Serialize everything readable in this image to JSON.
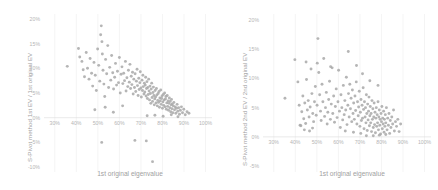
{
  "figure": {
    "background": "#ffffff",
    "marker_color": "#a8a8a8",
    "gridline_color": "#e9e9e9",
    "axis_color": "#dcdcdc",
    "text_color": "#a0a0a0"
  },
  "chart_data": [
    {
      "type": "scatter",
      "panel": "left",
      "title": "",
      "xlabel": "1st original eigenvalue",
      "ylabel": "S-Pivot method 1st EV / 1st original EV",
      "xticklabels": [
        "30%",
        "40%",
        "50%",
        "60%",
        "70%",
        "80%",
        "90%",
        "100%"
      ],
      "xtickvalues": [
        30,
        40,
        50,
        60,
        70,
        80,
        90,
        100
      ],
      "yticklabels": [
        "20%",
        "15%",
        "10%",
        "5%",
        "0%",
        "-5%",
        "-10%"
      ],
      "ytickvalues": [
        20,
        15,
        10,
        5,
        0,
        -5,
        -10
      ],
      "xlim": [
        25,
        103
      ],
      "ylim": [
        -11,
        21
      ],
      "grid": "vertical-light",
      "legend": "none",
      "n_points": 352,
      "correlation": -0.72,
      "cluster_center": [
        78,
        3.0
      ],
      "points": [
        [
          35.8,
          10.4
        ],
        [
          41.0,
          14.0
        ],
        [
          41.6,
          12.3
        ],
        [
          42.6,
          11.4
        ],
        [
          43.2,
          9.7
        ],
        [
          43.8,
          8.3
        ],
        [
          44.6,
          13.2
        ],
        [
          45.2,
          10.0
        ],
        [
          45.9,
          7.8
        ],
        [
          46.4,
          12.0
        ],
        [
          47.1,
          9.0
        ],
        [
          47.6,
          6.4
        ],
        [
          48.2,
          11.2
        ],
        [
          48.8,
          8.6
        ],
        [
          49.3,
          5.5
        ],
        [
          49.9,
          13.9
        ],
        [
          50.4,
          10.6
        ],
        [
          50.9,
          7.4
        ],
        [
          51.3,
          16.8
        ],
        [
          51.6,
          18.6
        ],
        [
          51.9,
          15.4
        ],
        [
          52.1,
          12.9
        ],
        [
          52.4,
          9.6
        ],
        [
          52.8,
          6.8
        ],
        [
          53.2,
          4.3
        ],
        [
          53.6,
          11.8
        ],
        [
          54.1,
          8.9
        ],
        [
          54.6,
          14.6
        ],
        [
          55.0,
          6.1
        ],
        [
          55.5,
          10.2
        ],
        [
          56.0,
          7.6
        ],
        [
          56.4,
          12.6
        ],
        [
          56.9,
          9.1
        ],
        [
          57.3,
          5.8
        ],
        [
          57.8,
          8.2
        ],
        [
          58.2,
          11.0
        ],
        [
          58.7,
          6.6
        ],
        [
          59.1,
          9.4
        ],
        [
          59.6,
          7.1
        ],
        [
          60.0,
          12.2
        ],
        [
          60.4,
          5.0
        ],
        [
          60.8,
          8.8
        ],
        [
          61.2,
          10.3
        ],
        [
          61.6,
          6.9
        ],
        [
          62.0,
          9.0
        ],
        [
          62.4,
          7.5
        ],
        [
          62.8,
          11.4
        ],
        [
          63.1,
          5.4
        ],
        [
          63.5,
          8.1
        ],
        [
          63.9,
          6.3
        ],
        [
          64.2,
          9.6
        ],
        [
          64.6,
          7.2
        ],
        [
          64.9,
          10.8
        ],
        [
          65.2,
          5.9
        ],
        [
          65.5,
          8.4
        ],
        [
          65.8,
          6.7
        ],
        [
          66.1,
          9.2
        ],
        [
          66.4,
          4.8
        ],
        [
          66.7,
          7.8
        ],
        [
          67.0,
          6.1
        ],
        [
          67.3,
          8.9
        ],
        [
          67.6,
          5.3
        ],
        [
          67.9,
          7.4
        ],
        [
          68.2,
          9.8
        ],
        [
          68.4,
          6.5
        ],
        [
          68.7,
          4.5
        ],
        [
          69.0,
          8.0
        ],
        [
          69.2,
          5.7
        ],
        [
          69.5,
          7.1
        ],
        [
          69.7,
          9.3
        ],
        [
          70.0,
          6.0
        ],
        [
          70.2,
          4.2
        ],
        [
          70.5,
          7.6
        ],
        [
          70.7,
          5.5
        ],
        [
          70.9,
          8.6
        ],
        [
          71.1,
          6.3
        ],
        [
          71.4,
          4.8
        ],
        [
          71.6,
          7.0
        ],
        [
          71.8,
          5.2
        ],
        [
          72.0,
          6.6
        ],
        [
          72.2,
          8.2
        ],
        [
          72.4,
          4.4
        ],
        [
          72.6,
          5.9
        ],
        [
          72.8,
          7.3
        ],
        [
          73.0,
          3.9
        ],
        [
          73.2,
          6.1
        ],
        [
          73.4,
          4.7
        ],
        [
          73.6,
          7.8
        ],
        [
          73.8,
          5.4
        ],
        [
          74.0,
          3.6
        ],
        [
          74.2,
          6.4
        ],
        [
          74.4,
          4.9
        ],
        [
          74.6,
          2.9
        ],
        [
          74.8,
          5.8
        ],
        [
          75.0,
          7.0
        ],
        [
          75.2,
          4.1
        ],
        [
          75.4,
          3.3
        ],
        [
          75.6,
          5.1
        ],
        [
          75.8,
          6.2
        ],
        [
          76.0,
          4.5
        ],
        [
          76.2,
          2.6
        ],
        [
          76.4,
          3.8
        ],
        [
          76.6,
          5.5
        ],
        [
          76.8,
          4.2
        ],
        [
          77.0,
          3.0
        ],
        [
          77.2,
          5.9
        ],
        [
          77.4,
          4.6
        ],
        [
          77.6,
          2.4
        ],
        [
          77.8,
          3.5
        ],
        [
          78.0,
          4.9
        ],
        [
          78.2,
          3.1
        ],
        [
          78.4,
          5.3
        ],
        [
          78.6,
          2.1
        ],
        [
          78.8,
          4.0
        ],
        [
          79.0,
          3.4
        ],
        [
          79.2,
          5.6
        ],
        [
          79.4,
          2.7
        ],
        [
          79.6,
          3.9
        ],
        [
          79.8,
          4.4
        ],
        [
          80.0,
          1.9
        ],
        [
          80.2,
          3.2
        ],
        [
          80.4,
          4.7
        ],
        [
          80.6,
          2.5
        ],
        [
          80.8,
          3.6
        ],
        [
          81.0,
          5.0
        ],
        [
          81.2,
          2.2
        ],
        [
          81.4,
          3.8
        ],
        [
          81.6,
          4.3
        ],
        [
          81.8,
          1.7
        ],
        [
          82.0,
          3.0
        ],
        [
          82.2,
          4.5
        ],
        [
          82.4,
          2.3
        ],
        [
          82.6,
          3.4
        ],
        [
          82.8,
          1.5
        ],
        [
          83.0,
          2.9
        ],
        [
          83.2,
          4.0
        ],
        [
          83.4,
          2.0
        ],
        [
          83.6,
          3.3
        ],
        [
          83.8,
          1.2
        ],
        [
          84.0,
          2.6
        ],
        [
          84.2,
          3.7
        ],
        [
          84.4,
          1.8
        ],
        [
          84.6,
          2.8
        ],
        [
          84.8,
          1.0
        ],
        [
          85.0,
          2.4
        ],
        [
          85.3,
          3.1
        ],
        [
          85.6,
          1.6
        ],
        [
          85.9,
          2.2
        ],
        [
          86.2,
          0.9
        ],
        [
          86.5,
          1.9
        ],
        [
          86.8,
          2.7
        ],
        [
          87.1,
          1.3
        ],
        [
          87.5,
          2.0
        ],
        [
          87.9,
          0.7
        ],
        [
          88.3,
          1.5
        ],
        [
          88.8,
          2.2
        ],
        [
          89.3,
          1.0
        ],
        [
          89.9,
          1.7
        ],
        [
          90.6,
          0.6
        ],
        [
          91.4,
          1.2
        ],
        [
          92.3,
          0.9
        ],
        [
          48.6,
          1.6
        ],
        [
          53.4,
          2.1
        ],
        [
          57.2,
          1.1
        ],
        [
          61.5,
          2.4
        ],
        [
          72.9,
          0.4
        ],
        [
          76.5,
          0.5
        ],
        [
          80.3,
          0.3
        ],
        [
          84.1,
          0.6
        ],
        [
          87.2,
          0.2
        ],
        [
          51.8,
          -5.0
        ],
        [
          67.2,
          -4.6
        ],
        [
          72.5,
          -4.7
        ],
        [
          75.4,
          -8.9
        ]
      ]
    },
    {
      "type": "scatter",
      "panel": "right",
      "title": "",
      "xlabel": "1st original eigenvalue",
      "ylabel": "S-Pivot method 2nd EV / 2nd original EV",
      "xticklabels": [
        "30%",
        "40%",
        "50%",
        "60%",
        "70%",
        "80%",
        "90%",
        "100%"
      ],
      "xtickvalues": [
        30,
        40,
        50,
        60,
        70,
        80,
        90,
        100
      ],
      "yticklabels": [
        "20%",
        "15%",
        "10%",
        "5%",
        "0%",
        "-5%"
      ],
      "ytickvalues": [
        20,
        15,
        10,
        5,
        0,
        -5
      ],
      "xlim": [
        25,
        103
      ],
      "ylim": [
        -6,
        21
      ],
      "grid": "vertical-light",
      "legend": "none",
      "n_points": 348,
      "correlation": -0.18,
      "cluster_center": [
        75,
        2.6
      ],
      "points": [
        [
          35.2,
          6.6
        ],
        [
          39.8,
          13.2
        ],
        [
          41.2,
          9.4
        ],
        [
          41.8,
          5.4
        ],
        [
          42.2,
          2.0
        ],
        [
          42.6,
          1.9
        ],
        [
          43.0,
          4.3
        ],
        [
          43.5,
          7.0
        ],
        [
          43.9,
          3.1
        ],
        [
          44.4,
          5.8
        ],
        [
          44.8,
          2.3
        ],
        [
          45.2,
          9.8
        ],
        [
          45.6,
          4.6
        ],
        [
          46.0,
          6.2
        ],
        [
          46.4,
          3.4
        ],
        [
          46.9,
          5.1
        ],
        [
          47.3,
          11.6
        ],
        [
          47.7,
          7.4
        ],
        [
          48.1,
          4.0
        ],
        [
          48.5,
          2.6
        ],
        [
          48.9,
          6.0
        ],
        [
          49.3,
          8.6
        ],
        [
          49.7,
          3.7
        ],
        [
          50.1,
          5.4
        ],
        [
          50.5,
          16.8
        ],
        [
          50.9,
          11.0
        ],
        [
          51.3,
          7.2
        ],
        [
          51.7,
          4.4
        ],
        [
          52.0,
          2.8
        ],
        [
          52.4,
          9.0
        ],
        [
          52.8,
          6.0
        ],
        [
          53.2,
          13.4
        ],
        [
          53.6,
          3.5
        ],
        [
          54.0,
          5.0
        ],
        [
          54.4,
          7.6
        ],
        [
          54.8,
          2.2
        ],
        [
          55.1,
          4.2
        ],
        [
          55.5,
          6.4
        ],
        [
          55.9,
          9.5
        ],
        [
          56.3,
          3.0
        ],
        [
          56.7,
          5.6
        ],
        [
          57.1,
          11.8
        ],
        [
          57.4,
          4.0
        ],
        [
          57.8,
          7.0
        ],
        [
          58.2,
          2.5
        ],
        [
          58.6,
          5.2
        ],
        [
          59.0,
          8.2
        ],
        [
          59.4,
          3.3
        ],
        [
          59.8,
          6.0
        ],
        [
          60.1,
          11.4
        ],
        [
          60.5,
          4.4
        ],
        [
          60.9,
          1.6
        ],
        [
          61.2,
          7.2
        ],
        [
          61.6,
          5.0
        ],
        [
          62.0,
          2.9
        ],
        [
          62.3,
          8.8
        ],
        [
          62.7,
          3.8
        ],
        [
          63.0,
          6.2
        ],
        [
          63.4,
          4.6
        ],
        [
          63.7,
          10.2
        ],
        [
          64.0,
          2.1
        ],
        [
          64.4,
          5.4
        ],
        [
          64.7,
          7.4
        ],
        [
          65.0,
          3.4
        ],
        [
          65.3,
          9.0
        ],
        [
          65.6,
          4.8
        ],
        [
          65.9,
          6.6
        ],
        [
          66.2,
          2.6
        ],
        [
          66.5,
          8.0
        ],
        [
          66.8,
          4.0
        ],
        [
          67.1,
          5.8
        ],
        [
          67.4,
          3.0
        ],
        [
          67.7,
          7.0
        ],
        [
          68.0,
          4.5
        ],
        [
          68.3,
          9.4
        ],
        [
          68.6,
          2.2
        ],
        [
          68.9,
          6.0
        ],
        [
          69.2,
          3.6
        ],
        [
          69.4,
          5.1
        ],
        [
          69.7,
          7.8
        ],
        [
          70.0,
          1.8
        ],
        [
          70.2,
          4.2
        ],
        [
          70.5,
          6.4
        ],
        [
          70.7,
          2.8
        ],
        [
          71.0,
          5.4
        ],
        [
          71.2,
          3.2
        ],
        [
          71.5,
          8.4
        ],
        [
          71.7,
          4.7
        ],
        [
          71.9,
          1.4
        ],
        [
          72.1,
          6.0
        ],
        [
          72.4,
          3.4
        ],
        [
          72.6,
          5.0
        ],
        [
          72.8,
          2.4
        ],
        [
          73.0,
          7.2
        ],
        [
          73.2,
          4.0
        ],
        [
          73.4,
          1.1
        ],
        [
          73.6,
          5.6
        ],
        [
          73.8,
          2.9
        ],
        [
          74.0,
          4.4
        ],
        [
          74.2,
          6.8
        ],
        [
          74.4,
          1.9
        ],
        [
          74.6,
          3.6
        ],
        [
          74.8,
          5.2
        ],
        [
          75.0,
          2.4
        ],
        [
          75.2,
          4.0
        ],
        [
          75.4,
          0.9
        ],
        [
          75.6,
          6.2
        ],
        [
          75.8,
          3.0
        ],
        [
          76.0,
          4.8
        ],
        [
          76.2,
          1.6
        ],
        [
          76.4,
          3.4
        ],
        [
          76.6,
          5.8
        ],
        [
          76.8,
          2.1
        ],
        [
          77.0,
          4.2
        ],
        [
          77.2,
          0.7
        ],
        [
          77.4,
          3.2
        ],
        [
          77.6,
          5.0
        ],
        [
          77.8,
          1.8
        ],
        [
          78.0,
          3.8
        ],
        [
          78.2,
          2.4
        ],
        [
          78.4,
          6.0
        ],
        [
          78.6,
          1.2
        ],
        [
          78.8,
          3.4
        ],
        [
          79.0,
          4.6
        ],
        [
          79.2,
          2.0
        ],
        [
          79.4,
          3.0
        ],
        [
          79.6,
          0.5
        ],
        [
          79.8,
          4.0
        ],
        [
          80.0,
          2.6
        ],
        [
          80.2,
          5.2
        ],
        [
          80.4,
          1.4
        ],
        [
          80.6,
          3.2
        ],
        [
          80.8,
          2.2
        ],
        [
          81.0,
          4.4
        ],
        [
          81.2,
          0.8
        ],
        [
          81.4,
          3.0
        ],
        [
          81.6,
          1.8
        ],
        [
          81.8,
          3.8
        ],
        [
          82.0,
          2.4
        ],
        [
          82.3,
          5.0
        ],
        [
          82.6,
          1.2
        ],
        [
          82.9,
          3.2
        ],
        [
          83.2,
          2.0
        ],
        [
          83.5,
          4.0
        ],
        [
          83.8,
          0.6
        ],
        [
          84.1,
          2.8
        ],
        [
          84.4,
          1.6
        ],
        [
          84.8,
          3.4
        ],
        [
          85.2,
          2.2
        ],
        [
          85.6,
          4.6
        ],
        [
          86.0,
          1.0
        ],
        [
          86.5,
          2.6
        ],
        [
          87.0,
          1.8
        ],
        [
          87.6,
          3.0
        ],
        [
          88.2,
          0.9
        ],
        [
          88.9,
          2.2
        ],
        [
          64.6,
          14.6
        ],
        [
          56.4,
          12.0
        ],
        [
          50.2,
          12.6
        ],
        [
          45.0,
          12.8
        ],
        [
          71.2,
          10.8
        ],
        [
          74.6,
          9.6
        ],
        [
          78.4,
          8.8
        ],
        [
          68.4,
          12.2
        ],
        [
          44.2,
          1.2
        ],
        [
          46.6,
          1.0
        ],
        [
          48.0,
          1.5
        ],
        [
          76.2,
          0.2
        ],
        [
          79.0,
          0.3
        ],
        [
          82.0,
          0.4
        ],
        [
          73.0,
          0.2
        ],
        [
          70.4,
          0.6
        ],
        [
          67.0,
          0.8
        ],
        [
          63.2,
          1.0
        ]
      ]
    }
  ]
}
